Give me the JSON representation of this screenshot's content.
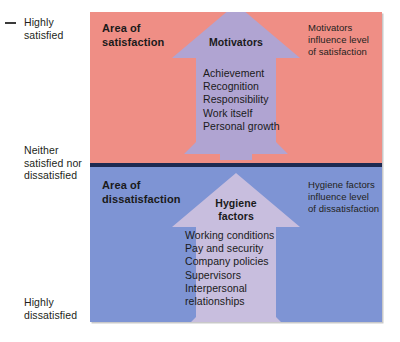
{
  "axis": {
    "labels": [
      {
        "id": "highly-satisfied",
        "text": "Highly\nsatisfied"
      },
      {
        "id": "neither",
        "text": "Neither\nsatisfied nor\ndissatisfied"
      },
      {
        "id": "highly-dissatisfied",
        "text": "Highly\ndissatisfied"
      }
    ]
  },
  "satisfaction": {
    "area_title": "Area of\nsatisfaction",
    "arrow_title": "Motivators",
    "factors": "Achievement\nRecognition\nResponsibility\nWork itself\nPersonal growth",
    "side_note": "Motivators\ninfluence level\nof satisfaction"
  },
  "dissatisfaction": {
    "area_title": "Area of\ndissatisfaction",
    "arrow_title": "Hygiene\nfactors",
    "factors": "Working conditions\nPay and security\nCompany policies\nSupervisors\nInterpersonal\nrelationships",
    "side_note": "Hygiene factors\ninfluence level\nof dissatisfaction"
  },
  "colors": {
    "satisfaction_background": "#ef8e85",
    "dissatisfaction_background": "#7e94d4",
    "divider": "#1d2a52",
    "arrow_over_pink": "#b0a4d2",
    "arrow_over_blue": "#c8bede",
    "text": "#1a1a1a"
  }
}
